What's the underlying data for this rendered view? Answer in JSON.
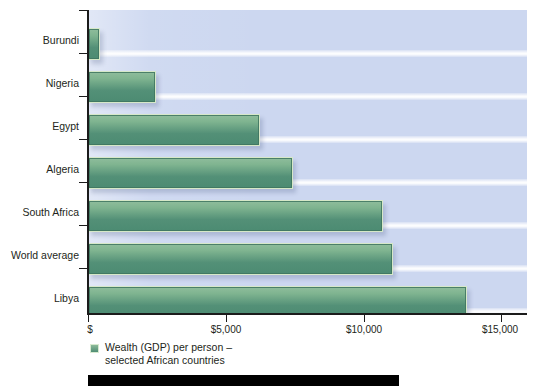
{
  "chart_data": {
    "type": "bar",
    "orientation": "horizontal",
    "title": "",
    "subtitle": "",
    "xlabel": "",
    "ylabel": "",
    "categories": [
      "Burundi",
      "Nigeria",
      "Egypt",
      "Algeria",
      "South Africa",
      "World average",
      "Libya"
    ],
    "values": [
      425,
      2470,
      6250,
      7430,
      10730,
      11070,
      13750
    ],
    "series": [
      {
        "name": "Wealth (GDP) per person – selected African countries",
        "values": [
          425,
          2470,
          6250,
          7430,
          10730,
          11070,
          13750
        ]
      }
    ],
    "xlim": [
      0,
      15000
    ],
    "xticks": [
      0,
      5000,
      10000,
      15000
    ],
    "xticklabels": [
      "$",
      "$5,000",
      "$10,000",
      "$15,000"
    ],
    "grid": false,
    "legend": {
      "position": "bottom-left",
      "entries": [
        {
          "label": "Wealth (GDP) per person –\nselected African countries",
          "color": "#4f8d74"
        }
      ]
    },
    "colors": {
      "bar_top": "#8fbd9c",
      "bar_bottom": "#4c8b72",
      "bar_border": "#d6e8c8",
      "plot_background": "#ccd7f0",
      "axis": "#1b1b1b",
      "text": "#231f20",
      "footer_bar": "#000000"
    },
    "annotations": []
  },
  "axis": {
    "x_tick_labels": [
      "$",
      "$5,000",
      "$10,000",
      "$15,000"
    ],
    "y_tick_labels": [
      "Burundi",
      "Nigeria",
      "Egypt",
      "Algeria",
      "South Africa",
      "World average",
      "Libya"
    ]
  },
  "legend": {
    "label": "Wealth (GDP) per person –\nselected African countries"
  }
}
